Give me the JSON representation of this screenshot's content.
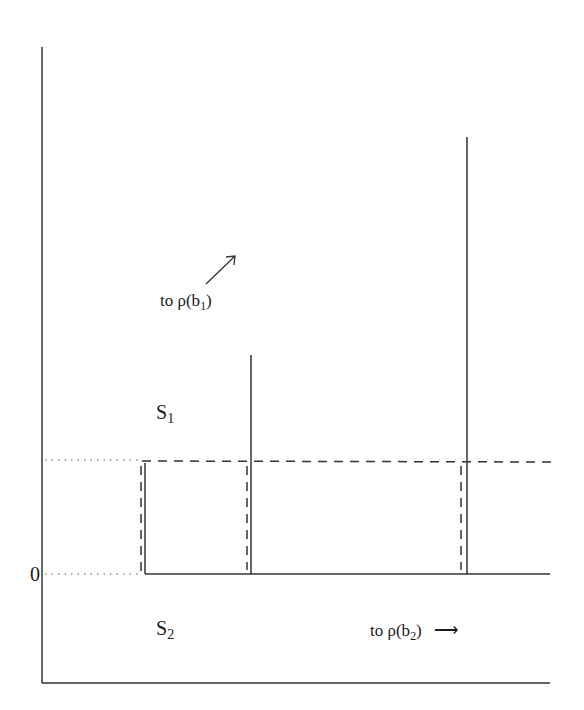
{
  "labels": {
    "zero": "0",
    "s1": {
      "base": "S",
      "sub": "1"
    },
    "s2": {
      "base": "S",
      "sub": "2"
    },
    "to_b1": {
      "prefix": "to ρ(b",
      "sub": "1",
      "suffix": ")"
    },
    "to_b2": {
      "prefix": "to ρ(b",
      "sub": "2",
      "suffix": ")"
    },
    "arrow_right": "⟶"
  },
  "colors": {
    "line": "#333333",
    "background": "#ffffff"
  },
  "geometry": {
    "y_axis_x": 42,
    "y_top": 47,
    "y_bottom_axis": 683,
    "zero_level_y": 574,
    "dashed_level_y": 460,
    "solid_verticals": [
      {
        "x": 145,
        "top": 462
      },
      {
        "x": 251,
        "top": 355
      },
      {
        "x": 467,
        "top": 137
      }
    ],
    "dashed_verticals": [
      140,
      247,
      462
    ]
  }
}
